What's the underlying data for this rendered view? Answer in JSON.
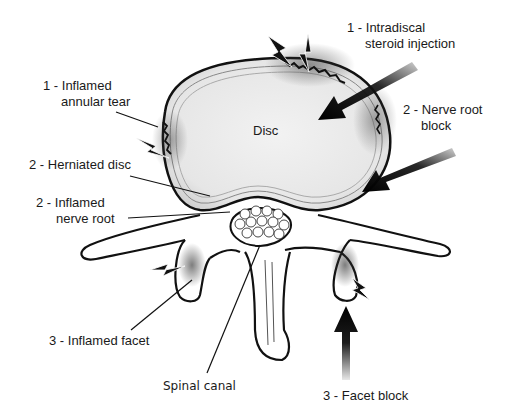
{
  "diagram": {
    "structures": {
      "disc": "Disc",
      "spinal_canal": "Spinal canal"
    },
    "labels": {
      "annular_tear": {
        "line1": "1 - Inflamed",
        "line2": "annular tear"
      },
      "intradiscal": {
        "line1": "1 - Intradiscal",
        "line2": "steroid injection"
      },
      "herniated": {
        "line1": "2 - Herniated disc"
      },
      "nerve_root_block": {
        "line1": "2 - Nerve root",
        "line2": "block"
      },
      "inflamed_nerve_root": {
        "line1": "2 - Inflamed",
        "line2": "nerve root"
      },
      "inflamed_facet": {
        "line1": "3 - Inflamed facet"
      },
      "facet_block": {
        "line1": "3 - Facet block"
      }
    },
    "icons": [
      "pain-lightning-icon",
      "injection-arrow-icon"
    ],
    "colors": {
      "line": "#111111",
      "disc_fill": "#ececec",
      "background": "#ffffff",
      "inflammation": "#555555"
    }
  }
}
